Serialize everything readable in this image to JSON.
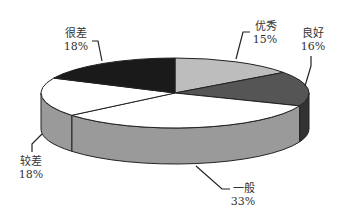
{
  "chart_data": {
    "type": "pie",
    "style": "3d-pie",
    "title": "",
    "categories": [
      "优秀",
      "良好",
      "一般",
      "较差",
      "很差"
    ],
    "values": [
      15,
      16,
      33,
      18,
      18
    ],
    "unit": "%",
    "labels": [
      "优秀 15%",
      "良好 16%",
      "一般 33%",
      "较差 18%",
      "很差 18%"
    ],
    "start_angle_deg": 0,
    "direction": "clockwise",
    "legend": "none",
    "slice_colors": {
      "top": [
        "#bdbdbd",
        "#555555",
        "#ffffff",
        "#ffffff",
        "#1a1a1a"
      ],
      "side": [
        "#9a9a9a",
        "#333333",
        "#9a9a9a",
        "#9a9a9a",
        "#111111"
      ]
    }
  },
  "labels": {
    "excellent": {
      "name": "优秀",
      "pct": "15%"
    },
    "good": {
      "name": "良好",
      "pct": "16%"
    },
    "average": {
      "name": "一般",
      "pct": "33%"
    },
    "poor": {
      "name": "较差",
      "pct": "18%"
    },
    "very_poor": {
      "name": "很差",
      "pct": "18%"
    }
  }
}
